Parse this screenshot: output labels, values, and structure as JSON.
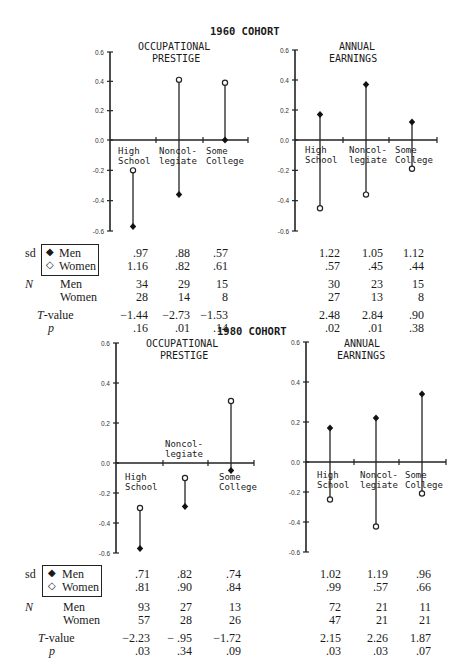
{
  "chart_data": [
    {
      "type": "dot-stem",
      "cohort": "1960 COHORT",
      "title": "OCCUPATIONAL PRESTIGE",
      "categories": [
        "High School",
        "Noncollegiate",
        "Some College"
      ],
      "ylim": [
        -0.6,
        0.6
      ],
      "yticks": [
        "0.6",
        "0.4",
        "0.2",
        "0.0",
        "-0.2",
        "-0.4",
        "-0.6"
      ],
      "series": [
        {
          "name": "Men",
          "marker": "filled-diamond",
          "values": [
            -0.57,
            -0.36,
            0.0
          ]
        },
        {
          "name": "Women",
          "marker": "open-diamond",
          "values": [
            -0.2,
            0.41,
            0.39
          ]
        }
      ],
      "table": {
        "sd_men": [
          ".97",
          ".88",
          ".57"
        ],
        "sd_women": [
          "1.16",
          ".82",
          ".61"
        ],
        "n_men": [
          "34",
          "29",
          "15"
        ],
        "n_women": [
          "28",
          "14",
          "8"
        ],
        "t_value": [
          "−1.44",
          "−2.73",
          "−1.53"
        ],
        "p": [
          ".16",
          ".01",
          ".14"
        ]
      }
    },
    {
      "type": "dot-stem",
      "cohort": "1960 COHORT",
      "title": "ANNUAL EARNINGS",
      "categories": [
        "High School",
        "Noncollegiate",
        "Some College"
      ],
      "ylim": [
        -0.6,
        0.6
      ],
      "yticks": [
        "0.6",
        "0.4",
        "0.2",
        "0.0",
        "-0.2",
        "-0.4",
        "-0.6"
      ],
      "series": [
        {
          "name": "Men",
          "marker": "filled-diamond",
          "values": [
            0.17,
            0.37,
            0.12
          ]
        },
        {
          "name": "Women",
          "marker": "open-diamond",
          "values": [
            -0.45,
            -0.36,
            -0.19
          ]
        }
      ],
      "table": {
        "sd_men": [
          "1.22",
          "1.05",
          "1.12"
        ],
        "sd_women": [
          ".57",
          ".45",
          ".44"
        ],
        "n_men": [
          "30",
          "23",
          "15"
        ],
        "n_women": [
          "27",
          "13",
          "8"
        ],
        "t_value": [
          "2.48",
          "2.84",
          ".90"
        ],
        "p": [
          ".02",
          ".01",
          ".38"
        ]
      }
    },
    {
      "type": "dot-stem",
      "cohort": "1980 COHORT",
      "title": "OCCUPATIONAL PRESTIGE",
      "categories": [
        "High School",
        "Noncollegiate",
        "Some College"
      ],
      "ylim": [
        -0.6,
        0.6
      ],
      "yticks": [
        "0.6",
        "0.4",
        "0.2",
        "0.0",
        "-0.2",
        "-0.4",
        "-0.6"
      ],
      "series": [
        {
          "name": "Men",
          "marker": "filled-diamond",
          "values": [
            -0.57,
            -0.29,
            -0.05
          ]
        },
        {
          "name": "Women",
          "marker": "open-diamond",
          "values": [
            -0.3,
            -0.1,
            0.31
          ]
        }
      ],
      "table": {
        "sd_men": [
          ".71",
          ".82",
          ".74"
        ],
        "sd_women": [
          ".81",
          ".90",
          ".84"
        ],
        "n_men": [
          "93",
          "27",
          "13"
        ],
        "n_women": [
          "57",
          "28",
          "26"
        ],
        "t_value": [
          "−2.23",
          "− .95",
          "−1.72"
        ],
        "p": [
          ".03",
          ".34",
          ".09"
        ]
      }
    },
    {
      "type": "dot-stem",
      "cohort": "1980 COHORT",
      "title": "ANNUAL EARNINGS",
      "categories": [
        "High School",
        "Noncollegiate",
        "Some College"
      ],
      "ylim": [
        -0.6,
        0.6
      ],
      "yticks": [
        "0.6",
        "0.4",
        "0.2",
        "0.0",
        "-0.2",
        "-0.4",
        "-0.6"
      ],
      "series": [
        {
          "name": "Men",
          "marker": "filled-diamond",
          "values": [
            0.17,
            0.22,
            0.34
          ]
        },
        {
          "name": "Women",
          "marker": "open-diamond",
          "values": [
            -0.25,
            -0.43,
            -0.21
          ]
        }
      ],
      "table": {
        "sd_men": [
          "1.02",
          "1.19",
          ".96"
        ],
        "sd_women": [
          ".99",
          ".57",
          ".66"
        ],
        "n_men": [
          "72",
          "21",
          "11"
        ],
        "n_women": [
          "47",
          "21",
          "21"
        ],
        "t_value": [
          "2.15",
          "2.26",
          "1.87"
        ],
        "p": [
          ".03",
          ".03",
          ".07"
        ]
      }
    }
  ],
  "labels": {
    "cohort1960": "1960 COHORT",
    "cohort1980": "1980 COHORT",
    "op_line1": "OCCUPATIONAL",
    "op_line2": "PRESTIGE",
    "ae_line1": "ANNUAL",
    "ae_line2": "EARNINGS",
    "hs1": "High",
    "hs2": "School",
    "nc1": "Noncol-",
    "nc2": "legiate",
    "sc1": "Some",
    "sc2": "College",
    "sd": "sd",
    "N": "N",
    "men": "Men",
    "women": "Women",
    "tvalue_T": "T",
    "tvalue_rest": "-value",
    "p": "p",
    "men_marker": "◆",
    "women_marker": "◇"
  },
  "yticks": [
    "0.6",
    "0.4",
    "0.2",
    "0.0",
    "-0.2",
    "-0.4",
    "-0.6"
  ]
}
